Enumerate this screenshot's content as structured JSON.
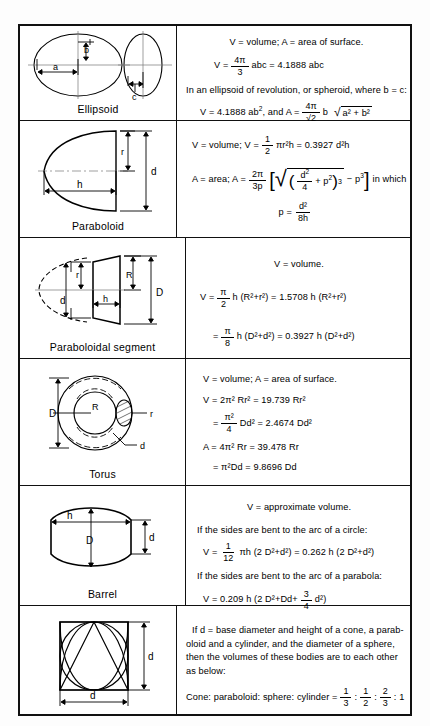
{
  "document": {
    "type": "geometry-formula-table",
    "columns": [
      "figure",
      "formulas"
    ]
  },
  "rows": [
    {
      "id": "ellipsoid",
      "label": "Ellipsoid",
      "figure_dimensions": [
        "b",
        "a",
        "c"
      ],
      "lines": [
        {
          "id": "e1",
          "text": "V  =  volume;   A  =  area of surface."
        },
        {
          "id": "e2",
          "parts": {
            "lead": "V  =",
            "num": "4π",
            "den": "3",
            "tail": "abc  =  4.1888 abc"
          }
        },
        {
          "id": "e3",
          "text": "In an ellipsoid of revolution, or spheroid, where b = c:"
        },
        {
          "id": "e4",
          "parts": {
            "lead": "V  =  4.1888 ab",
            "sup": "2",
            "mid": ", and A  =",
            "num": "4π",
            "den": "√2",
            "tail": "b",
            "radicand": "a² + b²"
          }
        }
      ]
    },
    {
      "id": "paraboloid",
      "label": "Paraboloid",
      "figure_dimensions": [
        "r",
        "d",
        "h"
      ],
      "lines": [
        {
          "id": "p1",
          "parts": {
            "lead": "V  =  volume;  V  =",
            "num": "1",
            "den": "2",
            "tail": "πr²h  =  0.3927 d²h"
          }
        },
        {
          "id": "p2",
          "parts": {
            "lead": "A  =  area;  A  =",
            "num": "2π",
            "den": "3p",
            "bracket": "√( d²/4 + p² )³  − p³",
            "tail": "in which"
          }
        },
        {
          "id": "p3",
          "parts": {
            "lead": "p  =",
            "num": "d²",
            "den": "8h"
          }
        }
      ]
    },
    {
      "id": "paraboloidal-segment",
      "label": "Paraboloidal segment",
      "figure_dimensions": [
        "r",
        "R",
        "d",
        "D",
        "h"
      ],
      "lines": [
        {
          "id": "ps1",
          "text": "V  =  volume."
        },
        {
          "id": "ps2",
          "parts": {
            "lead": "V  =",
            "num": "π",
            "den": "2",
            "tail": "h (R²+r²)  =  1.5708 h (R²+r²)"
          }
        },
        {
          "id": "ps3",
          "parts": {
            "lead": "=",
            "num": "π",
            "den": "8",
            "tail": "h (D²+d²)  =  0.3927 h (D²+d²)"
          }
        }
      ]
    },
    {
      "id": "torus",
      "label": "Torus",
      "figure_dimensions": [
        "D",
        "R",
        "r",
        "d"
      ],
      "lines": [
        {
          "id": "t1",
          "text": "V  =  volume;  A  =  area of surface."
        },
        {
          "id": "t2",
          "text": "V  =  2π² Rr² = 19.739 Rr²"
        },
        {
          "id": "t3",
          "parts": {
            "lead": "=",
            "num": "π²",
            "den": "4",
            "tail": "Dd²  =  2.4674 Dd²"
          }
        },
        {
          "id": "t4",
          "text": "A  =  4π² Rr  =  39.478 Rr"
        },
        {
          "id": "t5",
          "text": "=  π²Dd  =  9.8696 Dd"
        }
      ]
    },
    {
      "id": "barrel",
      "label": "Barrel",
      "figure_dimensions": [
        "h",
        "D",
        "d"
      ],
      "lines": [
        {
          "id": "b1",
          "text": "V  =  approximate volume."
        },
        {
          "id": "b2",
          "text": "If the sides are bent to the arc of a circle:"
        },
        {
          "id": "b3",
          "parts": {
            "lead": "V  =",
            "num": "1",
            "den": "12",
            "tail": "πh (2 D²+d²)  =  0.262 h (2 D²+d²)"
          }
        },
        {
          "id": "b4",
          "text": "If the sides are bent to the arc of a parabola:"
        },
        {
          "id": "b5",
          "parts": {
            "lead": "V  =  0.209 h (2 D²+Dd+",
            "num": "3",
            "den": "4",
            "tail": "d²)"
          }
        }
      ]
    },
    {
      "id": "ratios",
      "label": "",
      "figure_dimensions": [
        "d",
        "d"
      ],
      "lines": [
        {
          "id": "r1",
          "text": "If d = base diameter and height of a cone, a parab-"
        },
        {
          "id": "r2",
          "text": "oloid and a cylinder, and the diameter of a sphere,"
        },
        {
          "id": "r3",
          "text": "then the volumes of these bodies are to each other"
        },
        {
          "id": "r4",
          "text": "as below:"
        },
        {
          "id": "r5",
          "parts": {
            "lead": "Cone: paraboloid: sphere: cylinder  =",
            "f1n": "1",
            "f1d": "3",
            "sep1": ":",
            "f2n": "1",
            "f2d": "2",
            "sep2": ":",
            "f3n": "2",
            "f3d": "3",
            "tail": ": 1"
          }
        }
      ]
    }
  ],
  "colors": {
    "border": "#111111",
    "text": "#000000",
    "background": "#ffffff"
  }
}
